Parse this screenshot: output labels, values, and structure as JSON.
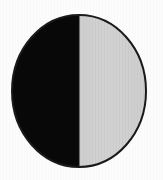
{
  "figure": {
    "name": "half-shaded-circle",
    "caption": "",
    "background_color": "#fcfcfc",
    "outline_color": "#1a1a1a",
    "outline_width_px": 2
  },
  "chart_data": {
    "type": "pie",
    "title": "",
    "subtitle": "",
    "xlabel": "",
    "ylabel": "",
    "legend_position": "none",
    "grid": false,
    "labels": [
      "Dark half",
      "Light half"
    ],
    "values": [
      50,
      50
    ],
    "units": "percent",
    "colors": [
      "#080808",
      "#cfcfcf"
    ],
    "start_angle_deg": 90,
    "direction": "counterclockwise",
    "annotations": []
  },
  "geometry": {
    "center_x": 79,
    "center_y": 91,
    "radius_x": 67,
    "radius_y": 76,
    "split_axis": "vertical",
    "split_x": 79
  },
  "segments": [
    {
      "id": "left-half",
      "label": "Dark half",
      "fill": "#080808",
      "share_percent": 50,
      "side": "left"
    },
    {
      "id": "right-half",
      "label": "Light half",
      "fill": "#cfcfcf",
      "share_percent": 50,
      "side": "right"
    }
  ]
}
